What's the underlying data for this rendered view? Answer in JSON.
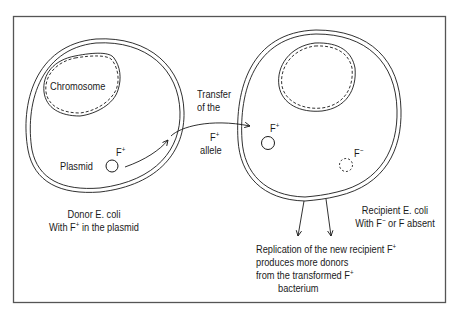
{
  "diagram": {
    "donor": {
      "chromosome_label": "Chromosome",
      "plasmid_label": "Plasmid",
      "plasmid_factor": "F",
      "plasmid_factor_sign": "+",
      "caption_line1": "Donor E. coli",
      "caption_line2_pre": "With F",
      "caption_line2_sign": "+",
      "caption_line2_post": " in the plasmid"
    },
    "transfer": {
      "line1": "Transfer",
      "line2": "of the",
      "line3_factor": "F",
      "line3_sign": "+",
      "line4": "allele"
    },
    "recipient": {
      "received_factor": "F",
      "received_sign": "+",
      "absent_factor": "F",
      "absent_sign": "−",
      "caption_line1": "Recipient E. coli",
      "caption_line2_pre": "With F",
      "caption_line2_sign": "−",
      "caption_line2_post": " or F absent"
    },
    "result": {
      "line1_pre": "Replication of the new recipient F",
      "line1_sign": "+",
      "line2": "produces more donors",
      "line3_pre": "from the transformed F",
      "line3_sign": "+",
      "line4": "bacterium"
    },
    "colors": {
      "ink": "#1a1a1a",
      "frame": "#555555",
      "background": "#ffffff"
    }
  }
}
